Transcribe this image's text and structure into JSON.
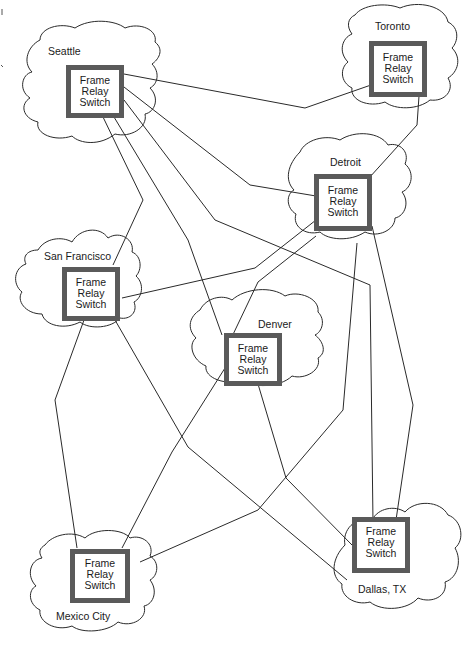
{
  "diagram": {
    "title": "",
    "switch_label_lines": [
      "Frame",
      "Relay",
      "Switch"
    ],
    "nodes": [
      {
        "id": "seattle",
        "city": "Seattle",
        "switch": [
          "Frame",
          "Relay",
          "Switch"
        ]
      },
      {
        "id": "toronto",
        "city": "Toronto",
        "switch": [
          "Frame",
          "Relay",
          "Switch"
        ]
      },
      {
        "id": "detroit",
        "city": "Detroit",
        "switch": [
          "Frame",
          "Relay",
          "Switch"
        ]
      },
      {
        "id": "san-francisco",
        "city": "San Francisco",
        "switch": [
          "Frame",
          "Relay",
          "Switch"
        ]
      },
      {
        "id": "denver",
        "city": "Denver",
        "switch": [
          "Frame",
          "Relay",
          "Switch"
        ]
      },
      {
        "id": "dallas",
        "city": "Dallas, TX",
        "switch": [
          "Frame",
          "Relay",
          "Switch"
        ]
      },
      {
        "id": "mexico-city",
        "city": "Mexico City",
        "switch": [
          "Frame",
          "Relay",
          "Switch"
        ]
      }
    ],
    "links": [
      [
        "seattle",
        "toronto"
      ],
      [
        "seattle",
        "detroit"
      ],
      [
        "seattle",
        "san-francisco"
      ],
      [
        "seattle",
        "denver"
      ],
      [
        "seattle",
        "dallas"
      ],
      [
        "toronto",
        "detroit"
      ],
      [
        "detroit",
        "san-francisco"
      ],
      [
        "detroit",
        "denver"
      ],
      [
        "detroit",
        "dallas"
      ],
      [
        "detroit",
        "mexico-city"
      ],
      [
        "san-francisco",
        "mexico-city"
      ],
      [
        "san-francisco",
        "dallas"
      ],
      [
        "denver",
        "mexico-city"
      ],
      [
        "denver",
        "dallas"
      ]
    ],
    "colors": {
      "switch_border": "#5a5a5a",
      "line": "#2a2a2a",
      "background": "#ffffff"
    }
  }
}
